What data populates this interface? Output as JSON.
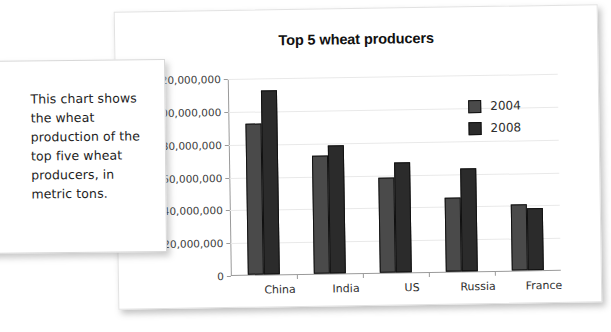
{
  "caption": {
    "text": "This chart shows the wheat production of the top five wheat producers, in metric tons."
  },
  "chart_data": {
    "type": "bar",
    "title": "Top 5 wheat producers",
    "xlabel": "",
    "ylabel": "",
    "ylim": [
      0,
      120000000
    ],
    "ytick_labels": [
      "0",
      "20,000,000",
      "40,000,000",
      "60,000,000",
      "80,000,000",
      "100,000,000",
      "120,000,000"
    ],
    "ytick_values": [
      0,
      20000000,
      40000000,
      60000000,
      80000000,
      100000000,
      120000000
    ],
    "grid": true,
    "legend_position": "inside-top-right",
    "categories": [
      "China",
      "India",
      "US",
      "Russia",
      "France"
    ],
    "series": [
      {
        "name": "2004",
        "color": "#4a4a4a",
        "values": [
          92000000,
          72000000,
          58000000,
          45000000,
          40000000
        ]
      },
      {
        "name": "2008",
        "color": "#2b2b2b",
        "values": [
          112000000,
          78000000,
          67000000,
          63000000,
          38000000
        ]
      }
    ]
  }
}
